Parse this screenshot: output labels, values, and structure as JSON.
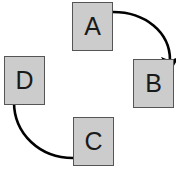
{
  "diagram": {
    "type": "cycle-flow-diagram",
    "canvas": {
      "width": 176,
      "height": 171,
      "background": "#ffffff"
    },
    "style": {
      "node_fill": "#cccccc",
      "node_border": "#555555",
      "arrow_color": "#000000",
      "label_color": "#1a1a1a"
    },
    "nodes": [
      {
        "id": "A",
        "label": "A",
        "x": 72,
        "y": 2,
        "width": 41,
        "height": 49
      },
      {
        "id": "B",
        "label": "B",
        "x": 133,
        "y": 59,
        "width": 41,
        "height": 49
      },
      {
        "id": "C",
        "label": "C",
        "x": 73,
        "y": 117,
        "width": 41,
        "height": 49
      },
      {
        "id": "D",
        "label": "D",
        "x": 4,
        "y": 56,
        "width": 41,
        "height": 49
      }
    ],
    "edges": [
      {
        "id": "edge-a-to-b",
        "from": "A",
        "to": "B",
        "label": "",
        "path": "M 113 12 C 145 12 170 32 170 60",
        "arrowhead": "down"
      },
      {
        "id": "edge-c-to-d",
        "from": "C",
        "to": "D",
        "label": "",
        "path": "M 73 158 C 40 158 14 134 14 102",
        "arrowhead": "up"
      }
    ]
  }
}
